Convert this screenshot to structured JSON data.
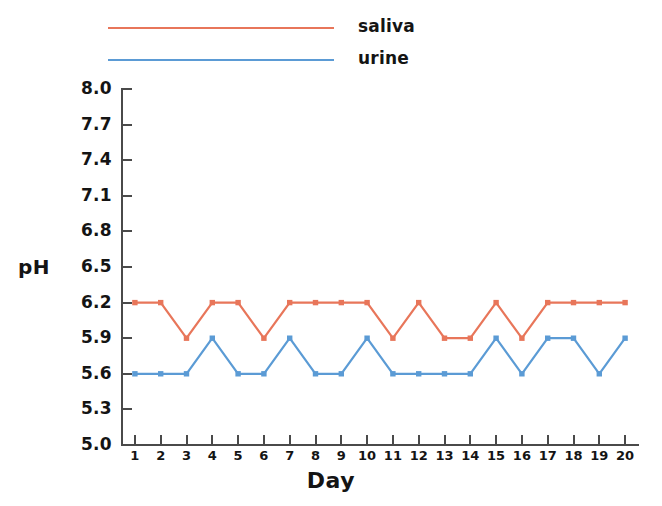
{
  "chart_data": {
    "type": "line",
    "title": "",
    "subtitle": "",
    "xlabel": "Day",
    "ylabel": "pH",
    "x": [
      1,
      2,
      3,
      4,
      5,
      6,
      7,
      8,
      9,
      10,
      11,
      12,
      13,
      14,
      15,
      16,
      17,
      18,
      19,
      20
    ],
    "categories": [
      "1",
      "2",
      "3",
      "4",
      "5",
      "6",
      "7",
      "8",
      "9",
      "10",
      "11",
      "12",
      "13",
      "14",
      "15",
      "16",
      "17",
      "18",
      "19",
      "20"
    ],
    "xlim": [
      0.5,
      20.5
    ],
    "ylim": [
      5.0,
      8.0
    ],
    "yticks": [
      "8.0",
      "7.7",
      "7.4",
      "7.1",
      "6.8",
      "6.5",
      "6.2",
      "5.9",
      "5.6",
      "5.3",
      "5.0"
    ],
    "ytick_values": [
      8.0,
      7.7,
      7.4,
      7.1,
      6.8,
      6.5,
      6.2,
      5.9,
      5.6,
      5.3,
      5.0
    ],
    "xticks": [
      "1",
      "2",
      "3",
      "4",
      "5",
      "6",
      "7",
      "8",
      "9",
      "10",
      "11",
      "12",
      "13",
      "14",
      "15",
      "16",
      "17",
      "18",
      "19",
      "20"
    ],
    "grid": false,
    "legend_position": "top-left",
    "markers": "square",
    "series": [
      {
        "name": "saliva",
        "color": "#E8765A",
        "values": [
          6.2,
          6.2,
          5.9,
          6.2,
          6.2,
          5.9,
          6.2,
          6.2,
          6.2,
          6.2,
          5.9,
          6.2,
          5.9,
          5.9,
          6.2,
          5.9,
          6.2,
          6.2,
          6.2,
          6.2
        ]
      },
      {
        "name": "urine",
        "color": "#5B9BD5",
        "values": [
          5.6,
          5.6,
          5.6,
          5.9,
          5.6,
          5.6,
          5.9,
          5.6,
          5.6,
          5.9,
          5.6,
          5.6,
          5.6,
          5.6,
          5.9,
          5.6,
          5.9,
          5.9,
          5.6,
          5.9
        ]
      }
    ]
  },
  "legend": {
    "items": [
      {
        "label": "saliva",
        "color": "#E8765A"
      },
      {
        "label": "urine",
        "color": "#5B9BD5"
      }
    ]
  },
  "axes": {
    "y_title": "pH",
    "x_title": "Day"
  },
  "colors": {
    "saliva": "#E8765A",
    "urine": "#5B9BD5",
    "axis": "#4a4a4a",
    "text": "#141414",
    "background": "#ffffff"
  }
}
